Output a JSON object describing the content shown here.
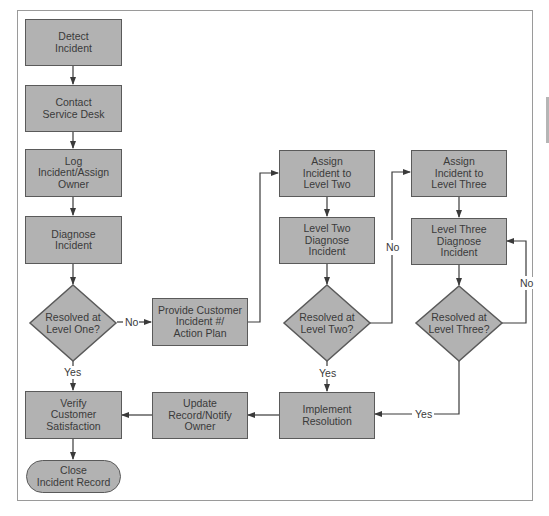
{
  "diagram": {
    "type": "flowchart",
    "title": "",
    "colors": {
      "node_fill": "#b2b2b2",
      "node_border": "#5a5a5a",
      "text": "#3a3a3a",
      "connector": "#3a3a3a",
      "frame": "#9a9a9a",
      "background": "#ffffff"
    },
    "nodes": {
      "detect": {
        "label": "Detect\nIncident",
        "shape": "rectangle"
      },
      "contact": {
        "label": "Contact\nService Desk",
        "shape": "rectangle"
      },
      "log": {
        "label": "Log\nIncident/Assign\nOwner",
        "shape": "rectangle"
      },
      "diagnose": {
        "label": "Diagnose\nIncident",
        "shape": "rectangle"
      },
      "resolved_one": {
        "label": "Resolved at\nLevel One?",
        "shape": "diamond"
      },
      "provide": {
        "label": "Provide Customer\nIncident #/\nAction Plan",
        "shape": "rectangle"
      },
      "assign_two": {
        "label": "Assign\nIncident to\nLevel Two",
        "shape": "rectangle"
      },
      "diagnose_two": {
        "label": "Level Two\nDiagnose\nIncident",
        "shape": "rectangle"
      },
      "resolved_two": {
        "label": "Resolved at\nLevel Two?",
        "shape": "diamond"
      },
      "assign_three": {
        "label": "Assign\nIncident to\nLevel Three",
        "shape": "rectangle"
      },
      "diagnose_three": {
        "label": "Level Three\nDiagnose\nIncident",
        "shape": "rectangle"
      },
      "resolved_three": {
        "label": "Resolved at\nLevel Three?",
        "shape": "diamond"
      },
      "implement": {
        "label": "Implement\nResolution",
        "shape": "rectangle"
      },
      "update": {
        "label": "Update\nRecord/Notify\nOwner",
        "shape": "rectangle"
      },
      "verify": {
        "label": "Verify\nCustomer\nSatisfaction",
        "shape": "rectangle"
      },
      "close": {
        "label": "Close\nIncident Record",
        "shape": "terminator"
      }
    },
    "edge_labels": {
      "one_no": "No",
      "one_yes": "Yes",
      "two_no": "No",
      "two_yes": "Yes",
      "three_no": "No",
      "three_yes": "Yes"
    },
    "edges": [
      {
        "from": "detect",
        "to": "contact",
        "label": ""
      },
      {
        "from": "contact",
        "to": "log",
        "label": ""
      },
      {
        "from": "log",
        "to": "diagnose",
        "label": ""
      },
      {
        "from": "diagnose",
        "to": "resolved_one",
        "label": ""
      },
      {
        "from": "resolved_one",
        "to": "provide",
        "label": "No"
      },
      {
        "from": "resolved_one",
        "to": "verify",
        "label": "Yes"
      },
      {
        "from": "provide",
        "to": "assign_two",
        "label": ""
      },
      {
        "from": "assign_two",
        "to": "diagnose_two",
        "label": ""
      },
      {
        "from": "diagnose_two",
        "to": "resolved_two",
        "label": ""
      },
      {
        "from": "resolved_two",
        "to": "assign_three",
        "label": "No"
      },
      {
        "from": "resolved_two",
        "to": "implement",
        "label": "Yes"
      },
      {
        "from": "assign_three",
        "to": "diagnose_three",
        "label": ""
      },
      {
        "from": "diagnose_three",
        "to": "resolved_three",
        "label": ""
      },
      {
        "from": "resolved_three",
        "to": "diagnose_three",
        "label": "No"
      },
      {
        "from": "resolved_three",
        "to": "implement",
        "label": "Yes"
      },
      {
        "from": "implement",
        "to": "update",
        "label": ""
      },
      {
        "from": "update",
        "to": "verify",
        "label": ""
      },
      {
        "from": "verify",
        "to": "close",
        "label": ""
      }
    ]
  }
}
